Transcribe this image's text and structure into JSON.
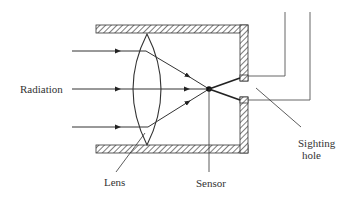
{
  "diagram": {
    "labels": {
      "radiation": "Radiation",
      "lens": "Lens",
      "sensor": "Sensor",
      "sighting_hole_line1": "Sighting",
      "sighting_hole_line2": "hole"
    },
    "colors": {
      "line": "#333333",
      "background": "#ffffff",
      "hatch": "#444444"
    },
    "components": [
      {
        "name": "housing",
        "description": "hatched enclosure walls (top, bottom, right)"
      },
      {
        "name": "lens",
        "description": "biconvex lens"
      },
      {
        "name": "sensor",
        "description": "point sensor at focal point"
      },
      {
        "name": "sighting-hole",
        "description": "aperture in right wall"
      },
      {
        "name": "rays",
        "count": 3,
        "description": "incoming parallel radiation rays converging to sensor"
      },
      {
        "name": "output-leads",
        "count": 2,
        "description": "L-shaped leads from right wall going upward"
      }
    ]
  }
}
